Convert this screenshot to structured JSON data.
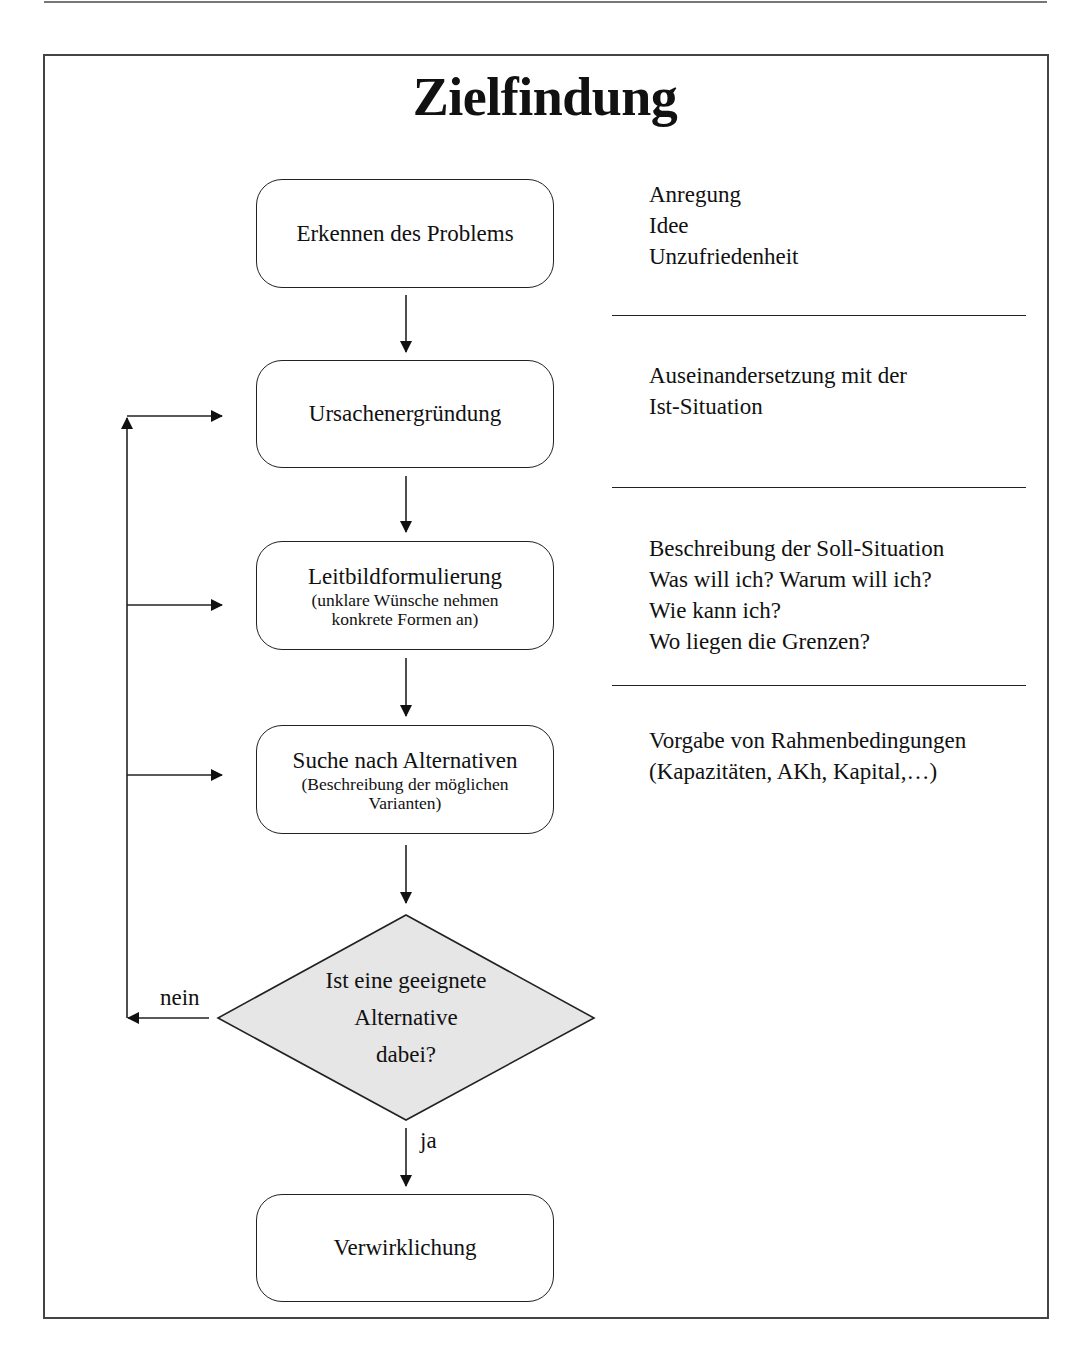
{
  "title": "Zielfindung",
  "steps": [
    {
      "label": "Erkennen des Problems",
      "sub": ""
    },
    {
      "label": "Ursachenergründung",
      "sub": ""
    },
    {
      "label": "Leitbildformulierung",
      "sub": "(unklare Wünsche nehmen konkrete Formen an)"
    },
    {
      "label": "Suche nach Alternativen",
      "sub": "(Beschreibung der möglichen Varianten)"
    }
  ],
  "decision": {
    "lines": [
      "Ist eine geeignete",
      "Alternative",
      "dabei?"
    ],
    "no_label": "nein",
    "yes_label": "ja"
  },
  "final_step": {
    "label": "Verwirklichung"
  },
  "notes": [
    {
      "lines": [
        "Anregung",
        "Idee",
        "Unzufriedenheit"
      ]
    },
    {
      "lines": [
        "Auseinandersetzung mit der",
        "Ist-Situation"
      ]
    },
    {
      "lines": [
        "Beschreibung der Soll-Situation",
        "Was will ich? Warum will ich?",
        "Wie kann ich?",
        "Wo liegen die Grenzen?"
      ]
    },
    {
      "lines": [
        "Vorgabe von Rahmenbedingungen",
        "(Kapazitäten, AKh, Kapital,…)"
      ]
    }
  ],
  "colors": {
    "decision_fill": "#e6e6e6",
    "stroke": "#222222"
  }
}
